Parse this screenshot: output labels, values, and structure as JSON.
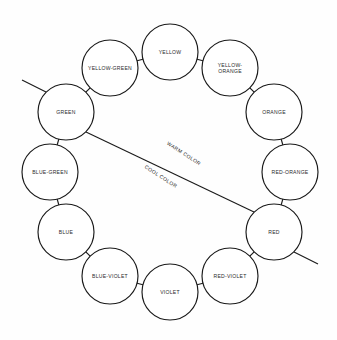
{
  "diagram": {
    "type": "color-wheel",
    "background_color": "#fefefe",
    "line_color": "#1a1a1a",
    "text_color": "#2b2b2b",
    "center": {
      "x": 170,
      "y": 172
    },
    "ring_radius": 120,
    "node_radius": 28,
    "hues": [
      {
        "id": "yellow",
        "label": "YELLOW",
        "lines": [
          "YELLOW"
        ],
        "angle_deg": -90,
        "cx": 170,
        "cy": 52,
        "r": 28
      },
      {
        "id": "yellow-orange",
        "label": "YELLOW-ORANGE",
        "lines": [
          "YELLOW-",
          "ORANGE"
        ],
        "angle_deg": -60,
        "cx": 230,
        "cy": 68,
        "r": 28
      },
      {
        "id": "orange",
        "label": "ORANGE",
        "lines": [
          "ORANGE"
        ],
        "angle_deg": -30,
        "cx": 274,
        "cy": 112,
        "r": 28
      },
      {
        "id": "red-orange",
        "label": "RED-ORANGE",
        "lines": [
          "RED-ORANGE"
        ],
        "angle_deg": 0,
        "cx": 290,
        "cy": 172,
        "r": 28
      },
      {
        "id": "red",
        "label": "RED",
        "lines": [
          "RED"
        ],
        "angle_deg": 30,
        "cx": 274,
        "cy": 232,
        "r": 28
      },
      {
        "id": "red-violet",
        "label": "RED-VIOLET",
        "lines": [
          "RED-VIOLET"
        ],
        "angle_deg": 60,
        "cx": 230,
        "cy": 276,
        "r": 28
      },
      {
        "id": "violet",
        "label": "VIOLET",
        "lines": [
          "VIOLET"
        ],
        "angle_deg": 90,
        "cx": 170,
        "cy": 292,
        "r": 28
      },
      {
        "id": "blue-violet",
        "label": "BLUE-VIOLET",
        "lines": [
          "BLUE-VIOLET"
        ],
        "angle_deg": 120,
        "cx": 110,
        "cy": 276,
        "r": 28
      },
      {
        "id": "blue",
        "label": "BLUE",
        "lines": [
          "BLUE"
        ],
        "angle_deg": 150,
        "cx": 66,
        "cy": 232,
        "r": 28
      },
      {
        "id": "blue-green",
        "label": "BLUE-GREEN",
        "lines": [
          "BLUE-GREEN"
        ],
        "angle_deg": 180,
        "cx": 50,
        "cy": 172,
        "r": 28
      },
      {
        "id": "green",
        "label": "GREEN",
        "lines": [
          "GREEN"
        ],
        "angle_deg": 210,
        "cx": 66,
        "cy": 112,
        "r": 28
      },
      {
        "id": "yellow-green",
        "label": "YELLOW-GREEN",
        "lines": [
          "YELLOW-GREEN"
        ],
        "angle_deg": 240,
        "cx": 110,
        "cy": 68,
        "r": 28
      }
    ],
    "zones": [
      {
        "id": "warm",
        "label": "WARM COLOR",
        "side": "upper-right",
        "x": 183,
        "y": 155,
        "rotate_deg": 33
      },
      {
        "id": "cool",
        "label": "COOL COLOR",
        "side": "lower-left",
        "x": 160,
        "y": 178,
        "rotate_deg": 33
      }
    ],
    "divider": {
      "from_hue": "green",
      "to_hue": "red",
      "x1": 86,
      "y1": 132,
      "x2": 254,
      "y2": 212
    },
    "ticks": [
      {
        "id": "green-tick",
        "hue": "green",
        "x1": 46,
        "y1": 92,
        "x2": 22,
        "y2": 80
      },
      {
        "id": "red-tick",
        "hue": "red",
        "x1": 294,
        "y1": 252,
        "x2": 318,
        "y2": 264
      }
    ]
  }
}
